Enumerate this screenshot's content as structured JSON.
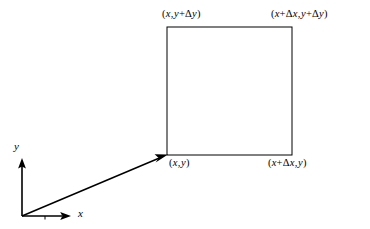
{
  "figure": {
    "type": "geometry-diagram",
    "background_color": "#ffffff",
    "line_color": "#000000",
    "width": 370,
    "height": 229
  },
  "axes": {
    "x_label": "x",
    "y_label": "y",
    "origin": {
      "x": 22,
      "y": 216
    },
    "x_axis_tip": {
      "x": 70,
      "y": 216
    },
    "y_axis_tip": {
      "x": 22,
      "y": 160
    },
    "tick_x": 45
  },
  "position_vector": {
    "name": "position-vector",
    "from": {
      "x": 22,
      "y": 216
    },
    "to": {
      "x": 167,
      "y": 155
    },
    "arrowhead": "filled-triangle"
  },
  "rectangle": {
    "left": 167,
    "top": 27,
    "right": 292,
    "bottom": 155,
    "width": 125,
    "height": 128,
    "stroke_width": 1,
    "fill": "none"
  },
  "labels": {
    "bottom_left": {
      "full": "(x, y)",
      "open": "(",
      "x_term": "x",
      "comma": ",",
      "y_term": "y",
      "close": ")"
    },
    "bottom_right": {
      "full": "(x+Δx, y)",
      "open": "(",
      "x_term": "x",
      "plus": "+",
      "delta": "Δ",
      "dx": "x",
      "comma": ",",
      "y_term": "y",
      "close": ")"
    },
    "top_left": {
      "full": "(x, y+Δy)",
      "open": "(",
      "x_term": "x",
      "comma": ",",
      "y_term": "y",
      "plus": "+",
      "delta": "Δ",
      "dy": "y",
      "close": ")"
    },
    "top_right": {
      "full": "(x+Δx, y+Δy)",
      "open": "(",
      "x_term": "x",
      "plus1": "+",
      "delta1": "Δ",
      "dx": "x",
      "comma": ",",
      "y_term": "y",
      "plus2": "+",
      "delta2": "Δ",
      "dy": "y",
      "close": ")"
    }
  }
}
